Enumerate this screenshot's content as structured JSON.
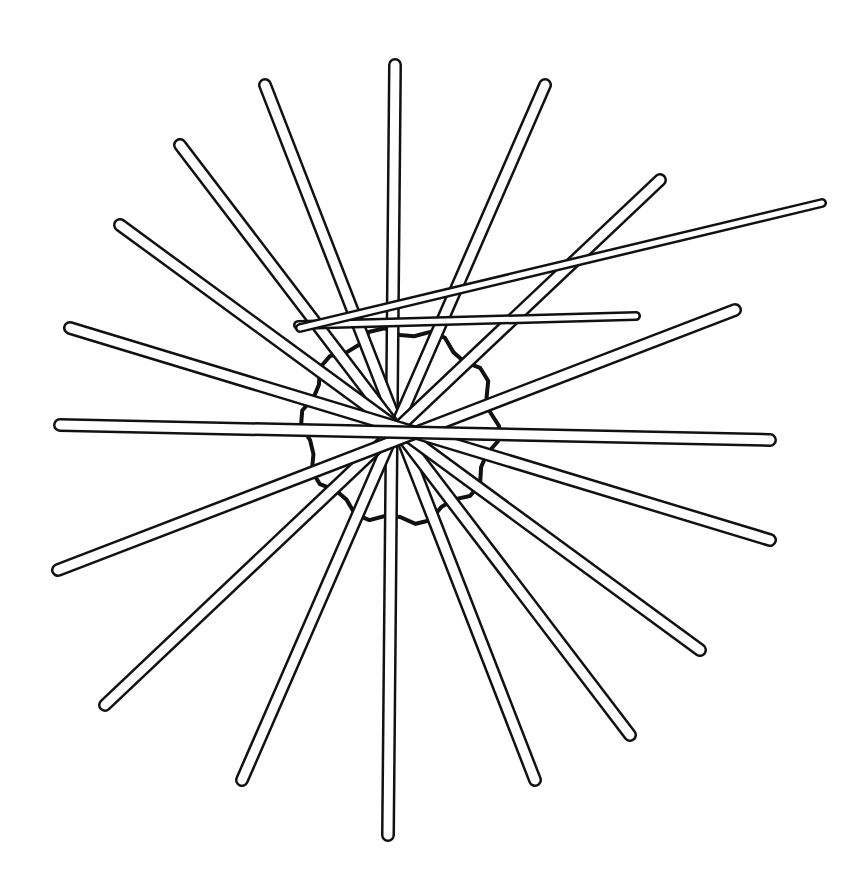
{
  "illustration": {
    "title": "Radiating sticks line drawing",
    "stroke_color": "#111111",
    "background": "#ffffff",
    "hub": {
      "cx": 400,
      "cy": 426,
      "r": 95
    },
    "sticks": [
      {
        "x1": 395,
        "y1": 65,
        "x2": 388,
        "y2": 835,
        "w": 14
      },
      {
        "x1": 265,
        "y1": 85,
        "x2": 535,
        "y2": 780,
        "w": 14
      },
      {
        "x1": 545,
        "y1": 85,
        "x2": 242,
        "y2": 780,
        "w": 14
      },
      {
        "x1": 180,
        "y1": 145,
        "x2": 630,
        "y2": 735,
        "w": 14
      },
      {
        "x1": 660,
        "y1": 180,
        "x2": 105,
        "y2": 705,
        "w": 14
      },
      {
        "x1": 120,
        "y1": 225,
        "x2": 700,
        "y2": 650,
        "w": 14
      },
      {
        "x1": 70,
        "y1": 328,
        "x2": 770,
        "y2": 540,
        "w": 14
      },
      {
        "x1": 735,
        "y1": 310,
        "x2": 58,
        "y2": 570,
        "w": 14
      },
      {
        "x1": 60,
        "y1": 425,
        "x2": 770,
        "y2": 440,
        "w": 14
      },
      {
        "x1": 298,
        "y1": 325,
        "x2": 636,
        "y2": 316,
        "w": 10
      },
      {
        "x1": 300,
        "y1": 328,
        "x2": 822,
        "y2": 203,
        "w": 10
      }
    ]
  }
}
